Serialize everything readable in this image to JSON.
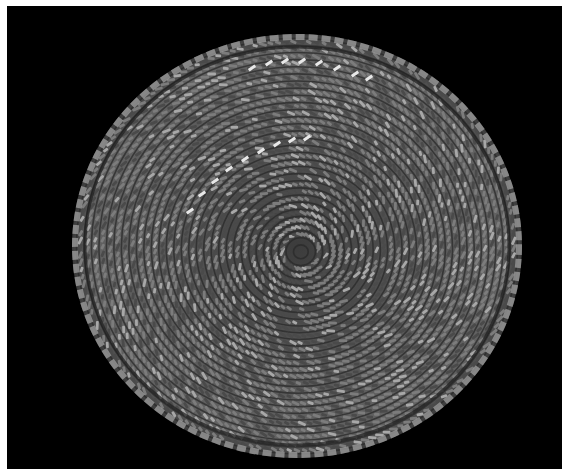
{
  "image": {
    "subject": "coiled woven basket viewed from above",
    "background_color": "#000000",
    "border_color": "#ffffff",
    "palette": {
      "base": "#5a5a5a",
      "dark": "#2a2a2a",
      "light": "#a8a8a8",
      "highlight": "#e8e8e8"
    },
    "description": "Grayscale photograph of a round coiled basket with spiral stitching pattern and a row of light accent stitches in the upper-left quadrant"
  }
}
